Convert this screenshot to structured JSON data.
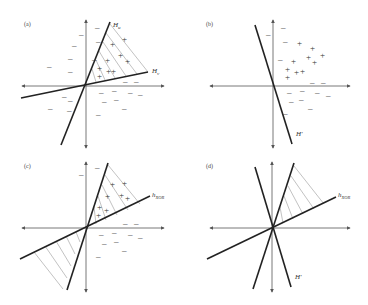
{
  "figure": {
    "panels": [
      {
        "id": "a",
        "label": "(a)",
        "hyperplanes": [
          {
            "name": "H_u",
            "label_main": "H",
            "label_sub": "u"
          },
          {
            "name": "H_v",
            "label_main": "H",
            "label_sub": "v"
          }
        ],
        "shaded_region": "intersection of positive sides of H_u and H_v (upper-right wedge)",
        "positive_points": 9,
        "negative_points": 22
      },
      {
        "id": "b",
        "label": "(b)",
        "hyperplanes": [
          {
            "name": "H'",
            "label_main": "H'",
            "label_sub": ""
          }
        ],
        "shaded_region": "none",
        "positive_points": 10,
        "negative_points": 14
      },
      {
        "id": "c",
        "label": "(c)",
        "hyperplanes": [
          {
            "name": "h_xor",
            "label_main": "h",
            "label_sub": "XOR"
          }
        ],
        "shaded_region": "upper-right wedge and lower-left wedge (XOR region)",
        "positive_points": 8,
        "negative_points": 12
      },
      {
        "id": "d",
        "label": "(d)",
        "hyperplanes": [
          {
            "name": "h_xor",
            "label_main": "h",
            "label_sub": "XOR"
          },
          {
            "name": "H'",
            "label_main": "H'",
            "label_sub": ""
          }
        ],
        "shaded_region": "upper-right wedge",
        "positive_points": 0,
        "negative_points": 0
      }
    ],
    "symbols": {
      "positive": "+",
      "negative": "–"
    },
    "colors": {
      "axis": "#555555",
      "hyperplane": "#222222",
      "hatch": "#999999",
      "background": "#ffffff"
    }
  }
}
